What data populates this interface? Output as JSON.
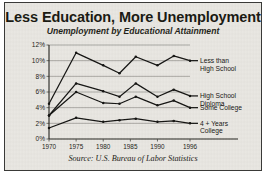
{
  "figure": {
    "title": "Less Education, More Unemployment",
    "subtitle": "Unemployment by Educational Attainment",
    "source": "Source: U.S. Bureau of Labor Statistics",
    "border_color": "#3a3a38",
    "background_color": "#e9e7e2",
    "line_color": "#121210",
    "grid_color": "#8e8c86"
  },
  "chart_data": {
    "type": "line",
    "title": "Less Education, More Unemployment",
    "subtitle": "Unemployment by Educational Attainment",
    "xlabel": "",
    "ylabel": "",
    "xlim": [
      1970,
      1996
    ],
    "ylim": [
      0,
      12
    ],
    "grid": true,
    "legend": "inline-right-labels",
    "ytick_labels": [
      "0%",
      "2%",
      "4%",
      "6%",
      "8%",
      "10%",
      "12%"
    ],
    "ytick_values": [
      0,
      2,
      4,
      6,
      8,
      10,
      12
    ],
    "xtick_labels": [
      "1970",
      "1975",
      "1980",
      "1985",
      "1990",
      "1996"
    ],
    "xtick_values": [
      1970,
      1975,
      1980,
      1985,
      1990,
      1996
    ],
    "x": [
      1970,
      1975,
      1980,
      1983,
      1986,
      1990,
      1993,
      1996
    ],
    "series": [
      {
        "name": "Less than High School",
        "label_line1": "Less than",
        "label_line2": "High School",
        "values": [
          4.5,
          11.0,
          9.4,
          8.4,
          10.5,
          9.4,
          10.6,
          10.0
        ]
      },
      {
        "name": "High School Diploma",
        "label_line1": "High School",
        "label_line2": "Diploma",
        "values": [
          3.0,
          7.1,
          6.1,
          5.4,
          7.1,
          5.4,
          6.3,
          5.5
        ]
      },
      {
        "name": "Some College",
        "label_line1": "Some College",
        "label_line2": "",
        "values": [
          3.0,
          6.0,
          4.6,
          4.5,
          5.4,
          4.3,
          4.9,
          4.0
        ]
      },
      {
        "name": "4 + Years College",
        "label_line1": "4 + Years",
        "label_line2": "College",
        "values": [
          1.4,
          2.7,
          2.2,
          2.4,
          2.6,
          2.2,
          2.3,
          2.0
        ]
      }
    ]
  }
}
